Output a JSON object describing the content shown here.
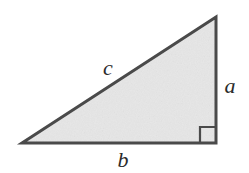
{
  "figure": {
    "name": "right-triangle-diagram",
    "background_color": "#ffffff",
    "fill_color": "#e3e3e3",
    "stroke_color": "#4a4a4a",
    "label_color": "#2b2b2b",
    "stroke_width": 3
  },
  "triangle": {
    "vertices": {
      "bottom_left": {
        "x": 22,
        "y": 143
      },
      "bottom_right": {
        "x": 216,
        "y": 143
      },
      "apex": {
        "x": 216,
        "y": 17
      }
    },
    "right_angle_marker": {
      "name": "right-angle-marker",
      "x": 200,
      "y": 127,
      "size": 16
    }
  },
  "labels": {
    "hypotenuse": "c",
    "vertical_leg": "a",
    "horizontal_leg": "b"
  }
}
